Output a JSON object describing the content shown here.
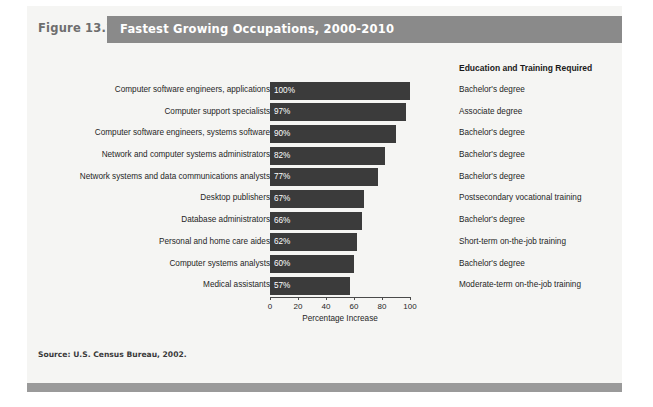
{
  "figure": {
    "number_label": "Figure 13.1",
    "title": "Fastest Growing Occupations, 2000-2010",
    "source": "Source: U.S. Census Bureau, 2002.",
    "education_column_header": "Education and Training Required",
    "header_bar_color": "#8a8a8a",
    "bar_color": "#3b3b3b",
    "footer_bar_color": "#9a9a9a",
    "panel_color": "#f5f5f3"
  },
  "chart_data": {
    "type": "bar",
    "orientation": "horizontal",
    "title": "Fastest Growing Occupations, 2000-2010",
    "xlabel": "Percentage Increase",
    "ylabel": "",
    "xlim": [
      0,
      100
    ],
    "xticks": [
      0,
      20,
      40,
      60,
      80,
      100
    ],
    "xtick_labels": [
      "0",
      "20",
      "40",
      "60",
      "80",
      "100"
    ],
    "grid": false,
    "legend": false,
    "categories": [
      "Computer software engineers, applications",
      "Computer support specialists",
      "Computer software engineers, systems software",
      "Network and computer systems administrators",
      "Network systems and data communications analysts",
      "Desktop publishers",
      "Database administrators",
      "Personal and home care aides",
      "Computer systems analysts",
      "Medical assistants"
    ],
    "values": [
      100,
      97,
      90,
      82,
      77,
      67,
      66,
      62,
      60,
      57
    ],
    "value_labels": [
      "100%",
      "97%",
      "90%",
      "82%",
      "77%",
      "67%",
      "66%",
      "62%",
      "60%",
      "57%"
    ],
    "annotations": [
      "Bachelor's degree",
      "Associate degree",
      "Bachelor's degree",
      "Bachelor's degree",
      "Bachelor's degree",
      "Postsecondary vocational training",
      "Bachelor's degree",
      "Short-term on-the-job training",
      "Bachelor's degree",
      "Moderate-term on-the-job training"
    ]
  }
}
